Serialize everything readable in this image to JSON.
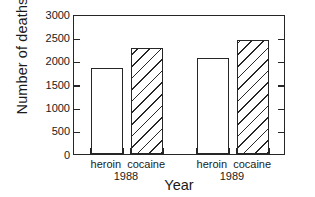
{
  "chart_data": {
    "type": "bar",
    "title": "",
    "xlabel": "Year",
    "ylabel": "Number of deaths",
    "ylim": [
      0,
      3000
    ],
    "ytick_values": [
      0,
      500,
      1000,
      1500,
      2000,
      2500,
      3000
    ],
    "ytick_labels": [
      "0",
      "500",
      "1000",
      "1500",
      "2000",
      "2500",
      "3000"
    ],
    "grid": false,
    "legend": "none",
    "groups": [
      {
        "group_label": "1988",
        "bars": [
          {
            "category": "heroin",
            "value": 1850,
            "fill": "solid"
          },
          {
            "category": "cocaine",
            "value": 2280,
            "fill": "hatched"
          }
        ]
      },
      {
        "group_label": "1989",
        "bars": [
          {
            "category": "heroin",
            "value": 2050,
            "fill": "solid"
          },
          {
            "category": "cocaine",
            "value": 2450,
            "fill": "hatched"
          }
        ]
      }
    ],
    "categories": [
      "heroin 1988",
      "cocaine 1988",
      "heroin 1989",
      "cocaine 1989"
    ],
    "values": [
      1850,
      2280,
      2050,
      2450
    ],
    "colors": {
      "axis": "#262626",
      "bar_edge": "#262626",
      "bar_face": "#ffffff",
      "hatch": "#262626",
      "text": "#1a1a1a",
      "background": "#ffffff"
    }
  }
}
